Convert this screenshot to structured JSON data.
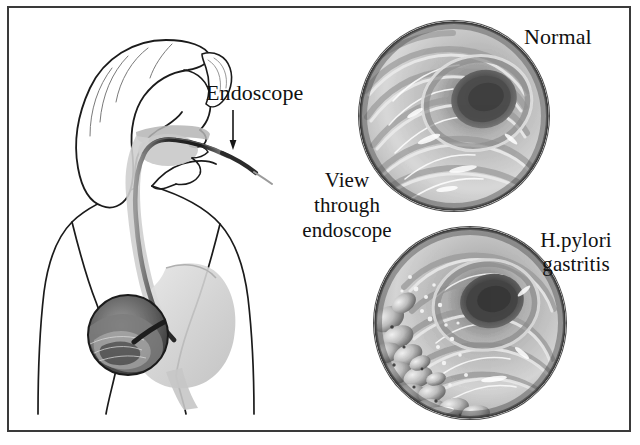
{
  "figure": {
    "border_color": "#3a3a3a",
    "background_color": "#ffffff",
    "ink_color": "#111111"
  },
  "labels": {
    "endoscope": "Endoscope",
    "view_through_endoscope": "View\nthrough\nendoscope",
    "normal": "Normal",
    "gastritis": "H.pylori\ngastritis"
  },
  "icons": {
    "down_arrow": "down-arrow-icon"
  },
  "anatomy": {
    "caption_parts": [
      "head",
      "mouth",
      "pharynx",
      "esophagus",
      "stomach",
      "duodenum",
      "endoscope-tube",
      "magnifier-inset"
    ],
    "line_color": "#1b1b1b",
    "organ_fill": "#d6d6d6"
  },
  "scope_views": [
    {
      "id": "normal",
      "label": "Normal",
      "description": "Smooth concentric gastric rugae converging on a dark central lumen",
      "lumen_color": "#4a4a4a",
      "mucosa_light": "#e2e2e2",
      "mucosa_dark": "#8f8f8f"
    },
    {
      "id": "gastritis",
      "label": "H.pylori gastritis",
      "description": "Nodular cobblestone inflamed mucosa along the left wall with dark central lumen",
      "lumen_color": "#3d3d3d",
      "mucosa_light": "#dedede",
      "mucosa_dark": "#838383",
      "nodule_color": "#bdbdbd"
    }
  ]
}
